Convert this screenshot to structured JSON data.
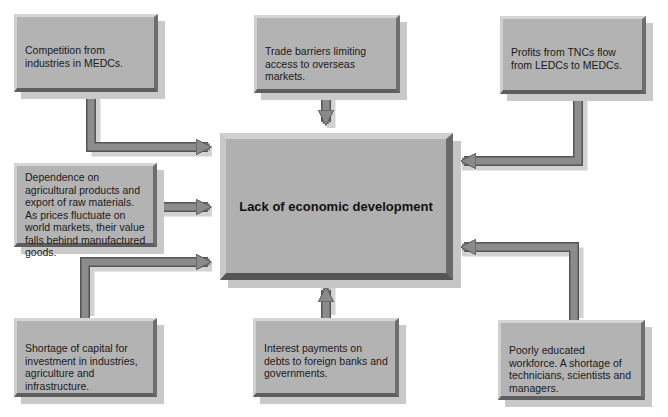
{
  "diagram": {
    "center": {
      "label": "Lack of economic development"
    },
    "causes": [
      {
        "id": "competition",
        "text": "Competition from industries in MEDCs."
      },
      {
        "id": "trade-barriers",
        "text": "Trade barriers limiting access to overseas markets."
      },
      {
        "id": "tnc-profits",
        "text": "Profits from TNCs flow from LEDCs to MEDCs."
      },
      {
        "id": "agri-dependence",
        "text": "Dependence on agricultural products and export of raw materials. As prices fluctuate on world markets, their value falls behind manufactured goods."
      },
      {
        "id": "capital-shortage",
        "text": "Shortage of capital for investment in industries, agriculture and infrastructure."
      },
      {
        "id": "interest-payments",
        "text": "Interest payments on debts to foreign banks and governments."
      },
      {
        "id": "education",
        "text": "Poorly educated workforce. A shortage of technicians, scientists and managers."
      }
    ],
    "colors": {
      "box": "#b3b3b3",
      "arrow": "#8a8a8a",
      "arrow_edge": "#555555",
      "shadow": "#c9c9c9"
    }
  }
}
